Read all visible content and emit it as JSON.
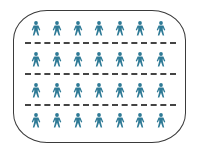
{
  "diagram": {
    "type": "pictogram-grid",
    "frame_shape": "rounded-rectangle",
    "rows": 4,
    "columns": 7,
    "total_icons": 28,
    "icon": "person-icon",
    "icon_color": "#2e7a96",
    "divider_style": "dashed",
    "divider_color": "#444444",
    "frame_color": "#3a3a3a",
    "dividers": 3
  }
}
